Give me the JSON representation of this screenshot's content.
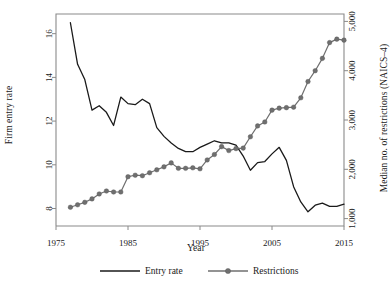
{
  "chart_data": {
    "type": "line",
    "title": "",
    "xlabel": "Year",
    "ylabel": "Firm entry rate",
    "ylabel_right": "Median no. of restrictions (NAICS–4)",
    "xlim": [
      1975,
      2015
    ],
    "ylim_left": [
      7.2,
      16.9
    ],
    "ylim_right": [
      850,
      5150
    ],
    "xticks": [
      1975,
      1985,
      1995,
      2005,
      2015
    ],
    "xticklabels": [
      "1975",
      "1985",
      "1995",
      "2005",
      "2015"
    ],
    "yticks_left": [
      8,
      10,
      12,
      14,
      16
    ],
    "yticklabels_left": [
      "8",
      "10",
      "12",
      "14",
      "16"
    ],
    "yticks_right": [
      1000,
      2000,
      3000,
      4000,
      5000
    ],
    "yticklabels_right": [
      "1,000",
      "2,000",
      "3,000",
      "4,000",
      "5,000"
    ],
    "grid": false,
    "legend_position": "below",
    "series": [
      {
        "name": "Entry rate",
        "axis": "left",
        "color": "#1a1a1a",
        "marker": "none",
        "x": [
          1977,
          1978,
          1979,
          1980,
          1981,
          1982,
          1983,
          1984,
          1985,
          1986,
          1987,
          1988,
          1989,
          1990,
          1991,
          1992,
          1993,
          1994,
          1995,
          1996,
          1997,
          1998,
          1999,
          2000,
          2001,
          2002,
          2003,
          2004,
          2005,
          2006,
          2007,
          2008,
          2009,
          2010,
          2011,
          2012,
          2013,
          2014,
          2015
        ],
        "values": [
          16.5,
          14.6,
          13.9,
          12.5,
          12.7,
          12.4,
          11.8,
          13.1,
          12.8,
          12.75,
          13.0,
          12.8,
          11.7,
          11.3,
          11.0,
          10.75,
          10.6,
          10.6,
          10.8,
          10.95,
          11.1,
          11.0,
          11.0,
          10.9,
          10.4,
          9.75,
          10.1,
          10.15,
          10.5,
          10.8,
          10.2,
          9.0,
          8.3,
          7.85,
          8.15,
          8.25,
          8.1,
          8.1,
          8.2
        ]
      },
      {
        "name": "Restrictions",
        "axis": "right",
        "color": "#6f6f6f",
        "marker": "circle",
        "x": [
          1977,
          1978,
          1979,
          1980,
          1981,
          1982,
          1983,
          1984,
          1985,
          1986,
          1987,
          1988,
          1989,
          1990,
          1991,
          1992,
          1993,
          1994,
          1995,
          1996,
          1997,
          1998,
          1999,
          2000,
          2001,
          2002,
          2003,
          2004,
          2005,
          2006,
          2007,
          2008,
          2009,
          2010,
          2011,
          2012,
          2013,
          2014,
          2015
        ],
        "values": [
          1230,
          1280,
          1330,
          1400,
          1500,
          1560,
          1540,
          1540,
          1850,
          1880,
          1870,
          1930,
          1990,
          2050,
          2130,
          2020,
          2020,
          2030,
          2010,
          2190,
          2300,
          2460,
          2380,
          2420,
          2430,
          2660,
          2880,
          2960,
          3200,
          3240,
          3250,
          3260,
          3450,
          3780,
          4000,
          4250,
          4570,
          4640,
          4620
        ]
      }
    ]
  },
  "legend": [
    {
      "label": "Entry rate",
      "style": "line",
      "color": "#1a1a1a"
    },
    {
      "label": "Restrictions",
      "style": "line-marker",
      "color": "#6f6f6f"
    }
  ]
}
